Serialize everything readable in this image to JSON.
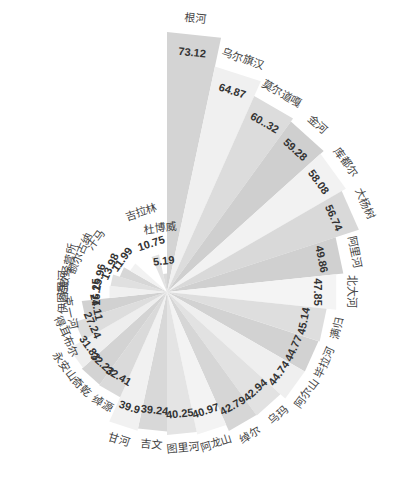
{
  "chart_data": {
    "type": "bar",
    "subtype": "polar-bar (rose / nightingale)",
    "title": "",
    "xlabel": "",
    "ylabel": "",
    "legend": "none",
    "grid": false,
    "start_angle_deg": 0,
    "direction": "clockwise",
    "categories": [
      "根河",
      "乌尔旗汉",
      "莫尔道嘎",
      "金河",
      "库都尔",
      "大杨树",
      "阿里河",
      "北大河",
      "满归",
      "毕拉河",
      "阿尔山",
      "乌玛",
      "绰尔",
      "阿龙山",
      "图里河",
      "吉文",
      "甘河",
      "绰源",
      "奇乾",
      "永安山",
      "得耳布尔",
      "克一河",
      "伊图里河",
      "诺敏经营所",
      "额尔古纳",
      "汗马",
      "吉拉林",
      "杜博威"
    ],
    "values": [
      73.12,
      64.87,
      60.32,
      59.28,
      58.08,
      56.74,
      49.86,
      47.85,
      45.14,
      44.77,
      44.74,
      42.94,
      42.79,
      40.97,
      40.25,
      39.24,
      39.9,
      32.41,
      32.23,
      31.83,
      27.24,
      24.11,
      16.25,
      15.96,
      13.98,
      11.99,
      10.75,
      5.19
    ],
    "value_labels": [
      "73.12",
      "64.87",
      "60..32",
      "59.28",
      "58.08",
      "56.74",
      "49.86",
      "47.85",
      "45.14",
      "44.77",
      "44.74",
      "42.94",
      "42.79",
      "40.97",
      "40.25",
      "39.24",
      "39.9",
      "32.41",
      "32.23",
      "31.83",
      "27.24",
      "24.11",
      "16.25",
      "15.96",
      "13.98",
      "11.99",
      "10.75",
      "5.19"
    ],
    "colors": [
      "#d4d4d4",
      "#f0f0f0",
      "#dcdcdc",
      "#cfcfcf",
      "#f2f2f2",
      "#d9d9d9",
      "#d0d0d0",
      "#f4f4f4",
      "#dedede",
      "#d2d2d2",
      "#efefef",
      "#e2e2e2",
      "#d6d6d6",
      "#f3f3f3",
      "#e4e4e4",
      "#d8d8d8",
      "#f1f1f1",
      "#dadada",
      "#d3d3d3",
      "#eeeeee",
      "#dddddd",
      "#d1d1d1",
      "#f0f0f0",
      "#e0e0e0",
      "#d7d7d7",
      "#f2f2f2",
      "#e3e3e3",
      "#dbdbdb"
    ]
  }
}
